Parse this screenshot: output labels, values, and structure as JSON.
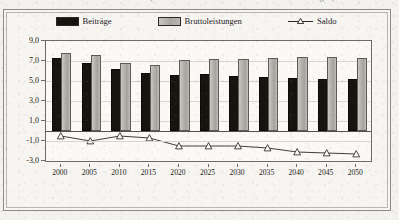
{
  "title": "der Jahre 2000 und 2050 (ohne Bundeszuschuss und ohne Altersrückstellungen)",
  "legend": {
    "items": [
      {
        "label": "Beiträge",
        "type": "bar",
        "color": "#17140f"
      },
      {
        "label": "Bruttoleistungen",
        "type": "bar",
        "color": "#b3afaa"
      },
      {
        "label": "Saldo",
        "type": "line",
        "color": "#2a2826",
        "marker": "open-triangle"
      }
    ]
  },
  "axes": {
    "y_ticks": [
      "9,0",
      "7,0",
      "5,0",
      "3,0",
      "1,0",
      "-1,0",
      "-3,0"
    ],
    "y_tick_values": [
      9.0,
      7.0,
      5.0,
      3.0,
      1.0,
      -1.0,
      -3.0
    ],
    "y_min": -3.0,
    "y_max": 9.0,
    "x_ticks": [
      "2000",
      "2005",
      "2010",
      "2015",
      "2020",
      "2025",
      "2030",
      "2035",
      "2040",
      "2045",
      "2050"
    ]
  },
  "chart_data": {
    "type": "bar",
    "title": "der Jahre 2000 und 2050 (ohne Bundeszuschuss und ohne Altersrückstellungen)",
    "xlabel": "",
    "ylabel": "",
    "ylim": [
      -3.0,
      9.0
    ],
    "grid": true,
    "legend_position": "top",
    "categories": [
      "2000",
      "2005",
      "2010",
      "2015",
      "2020",
      "2025",
      "2030",
      "2035",
      "2040",
      "2045",
      "2050"
    ],
    "series": [
      {
        "name": "Beiträge",
        "type": "bar",
        "color": "#17140f",
        "values": [
          7.1,
          6.6,
          6.0,
          5.6,
          5.4,
          5.5,
          5.3,
          5.2,
          5.1,
          5.0,
          5.0
        ]
      },
      {
        "name": "Bruttoleistungen",
        "type": "bar",
        "color": "#b3afaa",
        "values": [
          7.6,
          7.4,
          6.6,
          6.4,
          6.9,
          7.0,
          7.0,
          7.1,
          7.2,
          7.2,
          7.1
        ]
      },
      {
        "name": "Saldo",
        "type": "line",
        "color": "#2a2826",
        "marker": "open-triangle",
        "values": [
          -0.5,
          -1.0,
          -0.5,
          -0.7,
          -1.5,
          -1.5,
          -1.5,
          -1.7,
          -2.1,
          -2.2,
          -2.3
        ]
      }
    ]
  }
}
